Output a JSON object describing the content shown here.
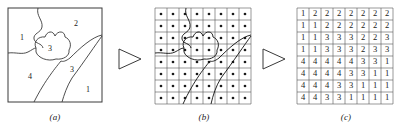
{
  "figure": {
    "kind": "image-digitization-diagram",
    "panels": [
      {
        "id": "a",
        "caption": "(a)",
        "title": "region map"
      },
      {
        "id": "b",
        "caption": "(b)",
        "title": "region map with sampling grid"
      },
      {
        "id": "c",
        "caption": "(c)",
        "title": "digitized label matrix"
      }
    ],
    "arrows": [
      {
        "id": "arrow-1",
        "glyph": "triangle-right-outline"
      },
      {
        "id": "arrow-2",
        "glyph": "triangle-right-outline"
      }
    ]
  },
  "panel_a": {
    "caption": "(a)",
    "region_labels": [
      {
        "text": "1",
        "x": 22,
        "y": 38
      },
      {
        "text": "2",
        "x": 76,
        "y": 24
      },
      {
        "text": "3",
        "x": 50,
        "y": 49
      },
      {
        "text": "4",
        "x": 30,
        "y": 77
      },
      {
        "text": "3",
        "x": 72,
        "y": 70
      },
      {
        "text": "1",
        "x": 88,
        "y": 90
      }
    ]
  },
  "panel_b": {
    "caption": "(b)",
    "grid": {
      "rows": 8,
      "cols": 8,
      "dot_marker": "filled-dot"
    }
  },
  "panel_c": {
    "caption": "(c)",
    "grid": {
      "rows": 8,
      "cols": 8
    },
    "matrix": [
      [
        1,
        2,
        2,
        2,
        2,
        2,
        2,
        2
      ],
      [
        1,
        1,
        2,
        2,
        2,
        2,
        2,
        2
      ],
      [
        1,
        1,
        3,
        3,
        3,
        2,
        2,
        3
      ],
      [
        1,
        1,
        3,
        3,
        3,
        2,
        3,
        3
      ],
      [
        4,
        4,
        4,
        4,
        4,
        3,
        3,
        1
      ],
      [
        4,
        4,
        4,
        4,
        3,
        3,
        1,
        1
      ],
      [
        4,
        4,
        4,
        3,
        3,
        1,
        1,
        1
      ],
      [
        4,
        4,
        3,
        3,
        1,
        1,
        1,
        1
      ]
    ]
  },
  "colors": {
    "ink": "#1a1a1a",
    "line": "#3a3a3a",
    "grid": "#555555",
    "background": "#ffffff"
  }
}
